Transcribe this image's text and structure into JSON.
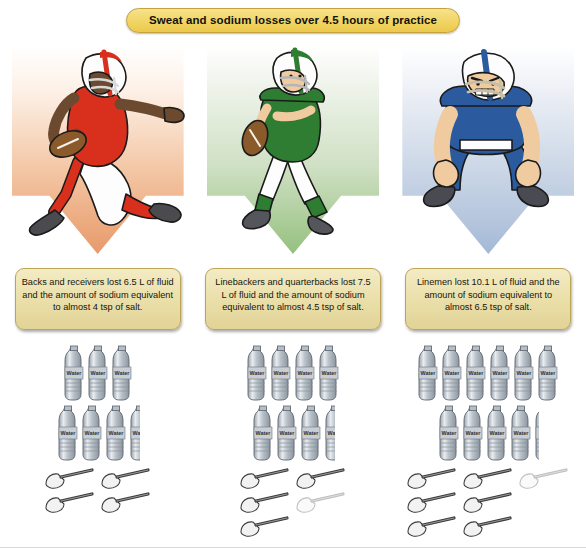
{
  "title": "Sweat and sodium losses over 4.5 hours of practice",
  "columns": [
    {
      "id": "backs-receivers",
      "athlete": "running-back-player",
      "arrow_color": "#e79a6b",
      "uniform_color": "#d8301d",
      "fact": "Backs and receivers lost 6.5 L of fluid and the amount of sodium equivalent to almost 4 tsp of salt.",
      "fluid_liters": 6.5,
      "salt_tsp": 4,
      "bottle_rows": [
        [
          1,
          1,
          1
        ],
        [
          1,
          1,
          1,
          0.5
        ]
      ],
      "spoon_rows": [
        [
          1,
          1
        ],
        [
          1,
          1
        ]
      ]
    },
    {
      "id": "linebackers-quarterbacks",
      "athlete": "quarterback-player",
      "arrow_color": "#95c07f",
      "uniform_color": "#2f7d32",
      "fact": "Linebackers and quarterbacks lost 7.5 L of fluid and the amount of sodium equivalent to almost 4.5 tsp of salt.",
      "fluid_liters": 7.5,
      "salt_tsp": 4.5,
      "bottle_rows": [
        [
          1,
          1,
          1,
          1
        ],
        [
          1,
          1,
          1,
          0.5
        ]
      ],
      "spoon_rows": [
        [
          1,
          1
        ],
        [
          1,
          0.5
        ],
        [
          1,
          0
        ]
      ]
    },
    {
      "id": "linemen",
      "athlete": "lineman-player",
      "arrow_color": "#a3b8d6",
      "uniform_color": "#2b5b9e",
      "fact": "Linemen lost 10.1 L of fluid and the amount of sodium equivalent to almost 6.5 tsp of salt.",
      "fluid_liters": 10.1,
      "salt_tsp": 6.5,
      "bottle_rows": [
        [
          1,
          1,
          1,
          1,
          1,
          1
        ],
        [
          1,
          1,
          1,
          1,
          0.1
        ]
      ],
      "spoon_rows": [
        [
          1,
          1,
          0.5
        ],
        [
          1,
          1
        ],
        [
          1,
          1
        ]
      ]
    }
  ],
  "icons": {
    "bottle": "water-bottle-icon",
    "bottle_label": "Water",
    "spoon": "teaspoon-of-salt-icon"
  }
}
